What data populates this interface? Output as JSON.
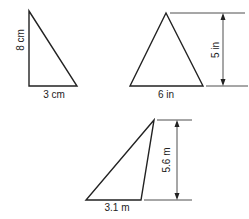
{
  "colors": {
    "stroke": "#222222",
    "background": "#ffffff"
  },
  "triangles": [
    {
      "id": "right-triangle",
      "height_label": "8 cm",
      "base_label": "3 cm"
    },
    {
      "id": "isosceles-triangle",
      "height_label": "5 in",
      "base_label": "6 in"
    },
    {
      "id": "obtuse-triangle",
      "height_label": "5.6 m",
      "base_label": "3.1 m"
    }
  ]
}
